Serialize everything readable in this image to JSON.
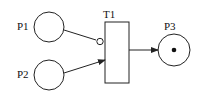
{
  "diagram": {
    "type": "petri-net",
    "places": [
      {
        "id": "P1",
        "label": "P1",
        "tokens": 0
      },
      {
        "id": "P2",
        "label": "P2",
        "tokens": 0
      },
      {
        "id": "P3",
        "label": "P3",
        "tokens": 1
      }
    ],
    "transitions": [
      {
        "id": "T1",
        "label": "T1"
      }
    ],
    "arcs": [
      {
        "from": "P1",
        "to": "T1",
        "kind": "inhibitor"
      },
      {
        "from": "P2",
        "to": "T1",
        "kind": "normal"
      },
      {
        "from": "T1",
        "to": "P3",
        "kind": "normal"
      }
    ],
    "colors": {
      "stroke": "#222222",
      "background": "#ffffff"
    }
  }
}
